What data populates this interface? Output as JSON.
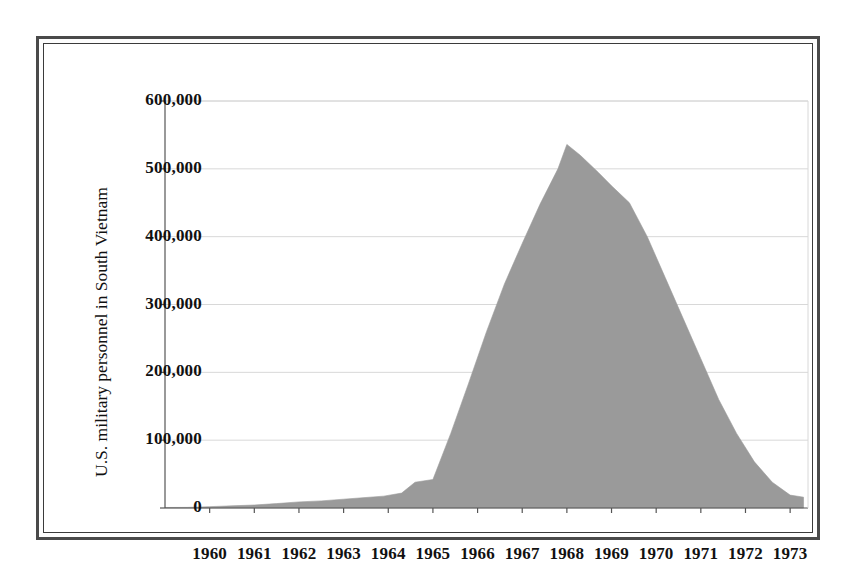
{
  "figure": {
    "frame_style": "double-rule-border",
    "background_color": "#ffffff",
    "area_fill_color": "#9a9a9a",
    "gridline_color": "#d8d8d8",
    "axis_color": "#555555",
    "text_color": "#111111"
  },
  "chart_data": {
    "type": "area",
    "title": "",
    "xlabel": "",
    "ylabel": "U.S. military personnel in South Vietnam",
    "xlim": [
      1959.0,
      1973.4
    ],
    "ylim": [
      0,
      600000
    ],
    "grid": true,
    "legend": "none",
    "x_tick_labels": [
      "1960",
      "1961",
      "1962",
      "1963",
      "1964",
      "1965",
      "1966",
      "1967",
      "1968",
      "1969",
      "1970",
      "1971",
      "1972",
      "1973"
    ],
    "x_tick_values": [
      1960,
      1961,
      1962,
      1963,
      1964,
      1965,
      1966,
      1967,
      1968,
      1969,
      1970,
      1971,
      1972,
      1973
    ],
    "y_tick_labels": [
      "0",
      "100,000",
      "200,000",
      "300,000",
      "400,000",
      "500,000",
      "600,000"
    ],
    "y_tick_values": [
      0,
      100000,
      200000,
      300000,
      400000,
      500000,
      600000
    ],
    "series": [
      {
        "name": "U.S. military personnel in South Vietnam",
        "x": [
          1959.0,
          1959.5,
          1960.0,
          1960.5,
          1961.0,
          1961.5,
          1962.0,
          1962.5,
          1963.0,
          1963.5,
          1963.9,
          1964.3,
          1964.6,
          1965.0,
          1965.4,
          1965.8,
          1966.2,
          1966.6,
          1967.0,
          1967.4,
          1967.8,
          1968.0,
          1968.3,
          1968.7,
          1969.0,
          1969.4,
          1969.8,
          1970.2,
          1970.6,
          1971.0,
          1971.4,
          1971.8,
          1972.2,
          1972.6,
          1973.0,
          1973.3
        ],
        "y": [
          760,
          900,
          2000,
          3200,
          4400,
          6500,
          9000,
          10500,
          13000,
          15500,
          17500,
          22000,
          38000,
          42000,
          110000,
          184000,
          260000,
          330000,
          390000,
          448000,
          500000,
          536000,
          520000,
          495000,
          475000,
          450000,
          400000,
          340000,
          280000,
          220000,
          160000,
          110000,
          68000,
          38000,
          19000,
          16000
        ]
      }
    ],
    "annotations": {
      "peak_label": "peak ≈ 536,000 in 1968",
      "start_label": "≈760 in 1959",
      "end_label": "≈16,000 in 1973"
    }
  },
  "axes": {
    "y_title": "U.S. military personnel in South Vietnam"
  }
}
